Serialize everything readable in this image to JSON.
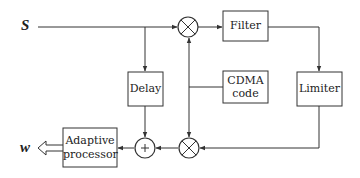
{
  "diagram": {
    "input_label": "S",
    "output_label": "w",
    "blocks": {
      "filter": "Filter",
      "limiter": "Limiter",
      "delay": "Delay",
      "cdma_line1": "CDMA",
      "cdma_line2": "code",
      "adaptive_line1": "Adaptive",
      "adaptive_line2": "processor"
    },
    "nodes": {
      "multiplier_top": "multiplier",
      "multiplier_bottom": "multiplier",
      "summer": "+"
    },
    "connections": [
      {
        "from": "S",
        "to": "multiplier_top"
      },
      {
        "from": "S",
        "to": "delay"
      },
      {
        "from": "multiplier_top",
        "to": "filter"
      },
      {
        "from": "filter",
        "to": "limiter"
      },
      {
        "from": "limiter",
        "to": "multiplier_bottom"
      },
      {
        "from": "cdma_code",
        "to": "multiplier_top"
      },
      {
        "from": "cdma_code",
        "to": "multiplier_bottom"
      },
      {
        "from": "multiplier_bottom",
        "to": "summer"
      },
      {
        "from": "delay",
        "to": "summer"
      },
      {
        "from": "summer",
        "to": "adaptive_processor"
      },
      {
        "from": "adaptive_processor",
        "to": "w"
      }
    ],
    "colors": {
      "line": "#333333",
      "background": "#ffffff"
    }
  }
}
